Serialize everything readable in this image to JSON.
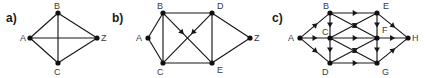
{
  "figure": {
    "background_color": "#ffffff",
    "ink_color": "#181818",
    "label_color": "#3a3a3a",
    "panels": [
      {
        "id": "a",
        "label": "a)",
        "label_x": 6,
        "label_y": 22,
        "directed": false,
        "nodes": [
          {
            "id": "A",
            "x": 30,
            "y": 38,
            "label": "A",
            "label_x": 20,
            "label_y": 41
          },
          {
            "id": "B",
            "x": 58,
            "y": 13,
            "label": "B",
            "label_x": 54,
            "label_y": 9
          },
          {
            "id": "C",
            "x": 58,
            "y": 63,
            "label": "C",
            "label_x": 54,
            "label_y": 75
          },
          {
            "id": "Z",
            "x": 97,
            "y": 38,
            "label": "Z",
            "label_x": 101,
            "label_y": 41
          }
        ],
        "edges": [
          {
            "from": "A",
            "to": "B",
            "directed": false
          },
          {
            "from": "A",
            "to": "C",
            "directed": false
          },
          {
            "from": "A",
            "to": "Z",
            "directed": false
          },
          {
            "from": "B",
            "to": "C",
            "directed": false
          },
          {
            "from": "B",
            "to": "Z",
            "directed": false
          },
          {
            "from": "C",
            "to": "Z",
            "directed": false
          }
        ]
      },
      {
        "id": "b",
        "label": "b)",
        "label_x": 112,
        "label_y": 22,
        "directed": false,
        "nodes": [
          {
            "id": "A",
            "x": 148,
            "y": 38,
            "label": "A",
            "label_x": 136,
            "label_y": 41
          },
          {
            "id": "B",
            "x": 163,
            "y": 13,
            "label": "B",
            "label_x": 157,
            "label_y": 9
          },
          {
            "id": "C",
            "x": 163,
            "y": 63,
            "label": "C",
            "label_x": 157,
            "label_y": 75
          },
          {
            "id": "D",
            "x": 212,
            "y": 13,
            "label": "D",
            "label_x": 217,
            "label_y": 9
          },
          {
            "id": "E",
            "x": 212,
            "y": 63,
            "label": "E",
            "label_x": 217,
            "label_y": 73
          },
          {
            "id": "Z",
            "x": 250,
            "y": 38,
            "label": "Z",
            "label_x": 254,
            "label_y": 41
          }
        ],
        "edges": [
          {
            "from": "A",
            "to": "B",
            "directed": false
          },
          {
            "from": "A",
            "to": "C",
            "directed": false
          },
          {
            "from": "B",
            "to": "C",
            "directed": false
          },
          {
            "from": "B",
            "to": "D",
            "directed": false
          },
          {
            "from": "C",
            "to": "E",
            "directed": false
          },
          {
            "from": "D",
            "to": "E",
            "directed": false
          },
          {
            "from": "D",
            "to": "Z",
            "directed": false
          },
          {
            "from": "E",
            "to": "Z",
            "directed": false
          },
          {
            "from": "B",
            "to": "E",
            "directed": true
          },
          {
            "from": "D",
            "to": "C",
            "directed": true
          }
        ]
      },
      {
        "id": "c",
        "label": "c)",
        "label_x": 272,
        "label_y": 22,
        "directed": true,
        "nodes": [
          {
            "id": "A",
            "x": 300,
            "y": 38,
            "label": "A",
            "label_x": 288,
            "label_y": 41
          },
          {
            "id": "B",
            "x": 330,
            "y": 13,
            "label": "B",
            "label_x": 323,
            "label_y": 9
          },
          {
            "id": "C",
            "x": 330,
            "y": 38,
            "label": "C",
            "label_x": 322,
            "label_y": 35
          },
          {
            "id": "D",
            "x": 330,
            "y": 63,
            "label": "D",
            "label_x": 322,
            "label_y": 75
          },
          {
            "id": "E",
            "x": 377,
            "y": 13,
            "label": "E",
            "label_x": 383,
            "label_y": 9
          },
          {
            "id": "F",
            "x": 377,
            "y": 38,
            "label": "F",
            "label_x": 382,
            "label_y": 33
          },
          {
            "id": "G",
            "x": 377,
            "y": 63,
            "label": "G",
            "label_x": 382,
            "label_y": 75
          },
          {
            "id": "H",
            "x": 408,
            "y": 38,
            "label": "H",
            "label_x": 412,
            "label_y": 41
          }
        ],
        "edges": [
          {
            "from": "A",
            "to": "B",
            "directed": true
          },
          {
            "from": "A",
            "to": "C",
            "directed": true
          },
          {
            "from": "A",
            "to": "D",
            "directed": true
          },
          {
            "from": "B",
            "to": "C",
            "directed": true
          },
          {
            "from": "C",
            "to": "D",
            "directed": true
          },
          {
            "from": "B",
            "to": "E",
            "directed": true
          },
          {
            "from": "B",
            "to": "F",
            "directed": true
          },
          {
            "from": "C",
            "to": "E",
            "directed": true
          },
          {
            "from": "C",
            "to": "F",
            "directed": true
          },
          {
            "from": "C",
            "to": "G",
            "directed": true
          },
          {
            "from": "D",
            "to": "F",
            "directed": true
          },
          {
            "from": "D",
            "to": "G",
            "directed": true
          },
          {
            "from": "E",
            "to": "F",
            "directed": true
          },
          {
            "from": "F",
            "to": "G",
            "directed": true
          },
          {
            "from": "E",
            "to": "H",
            "directed": true
          },
          {
            "from": "F",
            "to": "H",
            "directed": true
          },
          {
            "from": "G",
            "to": "H",
            "directed": true
          }
        ]
      }
    ]
  }
}
